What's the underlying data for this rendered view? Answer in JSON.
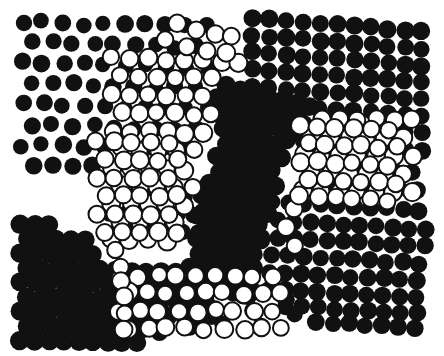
{
  "document": {
    "title": "Op-Art Circle Field",
    "kind": "abstract-halftone-artwork",
    "width": 444,
    "height": 356
  },
  "canvas": {
    "background_color": "#ffffff",
    "ink_color": "#111111",
    "artwork_bounds": {
      "x": 18,
      "y": 16,
      "width": 410,
      "height": 326
    }
  },
  "style": {
    "filled_color": "#111111",
    "outline_color": "#111111",
    "outline_fill": "#ffffff",
    "outline_stroke_width": 2.0,
    "base_radius": 8.2
  },
  "regions": [
    {
      "name": "top-left-sparse-filled",
      "note": "widely spaced solid dots on white, loose rows"
    },
    {
      "name": "top-right-dense-filled",
      "note": "tight grid of solid dots, rows slope down-right"
    },
    {
      "name": "center-diagonal-band",
      "note": "overlapping solid dots forming white diamond holes"
    },
    {
      "name": "mid-open-field",
      "note": "outline-only rings packed in rows"
    },
    {
      "name": "bottom-left-lattice",
      "note": "overlapping solid dots, diamond hole lattice"
    },
    {
      "name": "right-striped-rows",
      "note": "alternating solid rows sloping down to the right"
    },
    {
      "name": "bottom-sparse-mix",
      "note": "scattered solid dots and rings"
    }
  ],
  "chart_data": {
    "type": "scatter",
    "title": "Op-Art Circle Field",
    "xlabel": "",
    "ylabel": "",
    "xlim": [
      0,
      444
    ],
    "ylim": [
      0,
      356
    ],
    "grid": false,
    "legend": null,
    "marker_kinds": [
      "filled",
      "outline"
    ]
  }
}
